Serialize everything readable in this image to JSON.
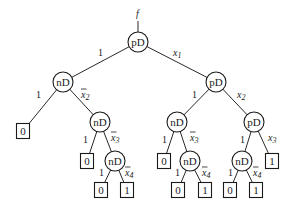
{
  "diagram": {
    "root_output_label": "f",
    "colors": {
      "stroke": "#1a1a1a",
      "background": "#ffffff"
    },
    "nodes": [
      {
        "id": "n0",
        "type": "pD",
        "x": 138,
        "y": 42
      },
      {
        "id": "n1",
        "type": "nD",
        "x": 63,
        "y": 82
      },
      {
        "id": "n2",
        "type": "pD",
        "x": 216,
        "y": 82
      },
      {
        "id": "n3",
        "type": "nD",
        "x": 100,
        "y": 122
      },
      {
        "id": "n4",
        "type": "nD",
        "x": 177,
        "y": 122
      },
      {
        "id": "n5",
        "type": "pD",
        "x": 254,
        "y": 122
      },
      {
        "id": "n6",
        "type": "nD",
        "x": 115,
        "y": 161
      },
      {
        "id": "n7",
        "type": "nD",
        "x": 190,
        "y": 161
      },
      {
        "id": "n8",
        "type": "nD",
        "x": 242,
        "y": 161
      }
    ],
    "leaves": [
      {
        "id": "l0",
        "value": "0",
        "x": 23,
        "y": 131
      },
      {
        "id": "l1",
        "value": "0",
        "x": 87,
        "y": 161
      },
      {
        "id": "l2",
        "value": "0",
        "x": 101,
        "y": 190
      },
      {
        "id": "l3",
        "value": "1",
        "x": 127,
        "y": 190
      },
      {
        "id": "l4",
        "value": "0",
        "x": 164,
        "y": 161
      },
      {
        "id": "l5",
        "value": "0",
        "x": 178,
        "y": 190
      },
      {
        "id": "l6",
        "value": "1",
        "x": 205,
        "y": 190
      },
      {
        "id": "l7",
        "value": "0",
        "x": 230,
        "y": 190
      },
      {
        "id": "l8",
        "value": "1",
        "x": 256,
        "y": 190
      },
      {
        "id": "l9",
        "value": "1",
        "x": 272,
        "y": 161
      }
    ],
    "edges": [
      {
        "from": "n0",
        "to": "n1",
        "label": "1",
        "var": false,
        "bar": false,
        "lx": 98,
        "ly": 56
      },
      {
        "from": "n0",
        "to": "n2",
        "label": "x",
        "sub": "1",
        "var": true,
        "bar": false,
        "lx": 173,
        "ly": 56
      },
      {
        "from": "n1",
        "to": "l0",
        "label": "1",
        "var": false,
        "bar": false,
        "lx": 36,
        "ly": 98
      },
      {
        "from": "n1",
        "to": "n3",
        "label": "x",
        "sub": "2",
        "var": true,
        "bar": true,
        "lx": 81,
        "ly": 98
      },
      {
        "from": "n2",
        "to": "n4",
        "label": "1",
        "var": false,
        "bar": false,
        "lx": 192,
        "ly": 98
      },
      {
        "from": "n2",
        "to": "n5",
        "label": "x",
        "sub": "2",
        "var": true,
        "bar": false,
        "lx": 237,
        "ly": 98
      },
      {
        "from": "n3",
        "to": "l1",
        "label": "1",
        "var": false,
        "bar": false,
        "lx": 83,
        "ly": 143
      },
      {
        "from": "n3",
        "to": "n6",
        "label": "x",
        "sub": "3",
        "var": true,
        "bar": true,
        "lx": 111,
        "ly": 141
      },
      {
        "from": "n4",
        "to": "l4",
        "label": "1",
        "var": false,
        "bar": false,
        "lx": 162,
        "ly": 143
      },
      {
        "from": "n4",
        "to": "n7",
        "label": "x",
        "sub": "3",
        "var": true,
        "bar": true,
        "lx": 190,
        "ly": 141
      },
      {
        "from": "n5",
        "to": "n8",
        "label": "1",
        "var": false,
        "bar": false,
        "lx": 240,
        "ly": 143
      },
      {
        "from": "n5",
        "to": "l9",
        "label": "x",
        "sub": "3",
        "var": true,
        "bar": false,
        "lx": 268,
        "ly": 141
      },
      {
        "from": "n6",
        "to": "l2",
        "label": "1",
        "var": false,
        "bar": false,
        "lx": 99,
        "ly": 176
      },
      {
        "from": "n6",
        "to": "l3",
        "label": "x",
        "sub": "4",
        "var": true,
        "bar": true,
        "lx": 125,
        "ly": 176
      },
      {
        "from": "n7",
        "to": "l5",
        "label": "1",
        "var": false,
        "bar": false,
        "lx": 175,
        "ly": 176
      },
      {
        "from": "n7",
        "to": "l6",
        "label": "x",
        "sub": "4",
        "var": true,
        "bar": true,
        "lx": 202,
        "ly": 176
      },
      {
        "from": "n8",
        "to": "l7",
        "label": "1",
        "var": false,
        "bar": false,
        "lx": 228,
        "ly": 176
      },
      {
        "from": "n8",
        "to": "l8",
        "label": "x",
        "sub": "4",
        "var": true,
        "bar": true,
        "lx": 253,
        "ly": 176
      }
    ]
  }
}
